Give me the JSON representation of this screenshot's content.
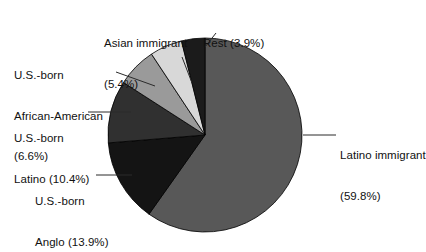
{
  "chart_data": {
    "type": "pie",
    "title": "",
    "subtitle": "",
    "xlabel": "",
    "ylabel": "",
    "legend_position": "callout-labels",
    "grid": false,
    "units": "percent",
    "start_angle_deg": 0,
    "direction": "clockwise",
    "categories": [
      "Latino immigrant",
      "U.S.-born Anglo",
      "U.S.-born Latino",
      "U.S.-born African-American",
      "Asian immigrant",
      "Rest"
    ],
    "values": [
      59.8,
      13.9,
      10.4,
      6.6,
      5.4,
      3.9
    ],
    "slices": [
      {
        "name": "latino-immigrant",
        "label_line1": "Latino immigrant",
        "label_line2": "(59.8%)",
        "value": 59.8,
        "value_text": "59.8%",
        "color": "#585858"
      },
      {
        "name": "us-born-anglo",
        "label_line1": "U.S.-born",
        "label_line2": "Anglo (13.9%)",
        "value": 13.9,
        "value_text": "13.9%",
        "color": "#141414"
      },
      {
        "name": "us-born-latino",
        "label_line1": "U.S.-born",
        "label_line2": "Latino (10.4%)",
        "value": 10.4,
        "value_text": "10.4%",
        "color": "#303030"
      },
      {
        "name": "us-born-african-american",
        "label_line1": "U.S.-born",
        "label_line2": "African-American",
        "label_line3": "(6.6%)",
        "value": 6.6,
        "value_text": "6.6%",
        "color": "#9a9a9a"
      },
      {
        "name": "asian-immigrant",
        "label_line1": "Asian immigrant",
        "label_line2": "(5.4%)",
        "value": 5.4,
        "value_text": "5.4%",
        "color": "#d8d8d8"
      },
      {
        "name": "rest",
        "label_line1": "Rest (3.9%)",
        "value": 3.9,
        "value_text": "3.9%",
        "color": "#1b1b1b"
      }
    ],
    "outline_color": "#000000",
    "background": "#ffffff"
  },
  "labels": {
    "asian_immigrant_l1": "Asian immigrant",
    "asian_immigrant_l2": "(5.4%)",
    "rest_l1": "Rest (3.9%)",
    "african_american_l1": "U.S.-born",
    "african_american_l2": "African-American",
    "african_american_l3": "(6.6%)",
    "usborn_latino_l1": "U.S.-born",
    "usborn_latino_l2": "Latino (10.4%)",
    "usborn_anglo_l1": "U.S.-born",
    "usborn_anglo_l2": "Anglo (13.9%)",
    "latino_immigrant_l1": "Latino immigrant",
    "latino_immigrant_l2": "(59.8%)"
  }
}
